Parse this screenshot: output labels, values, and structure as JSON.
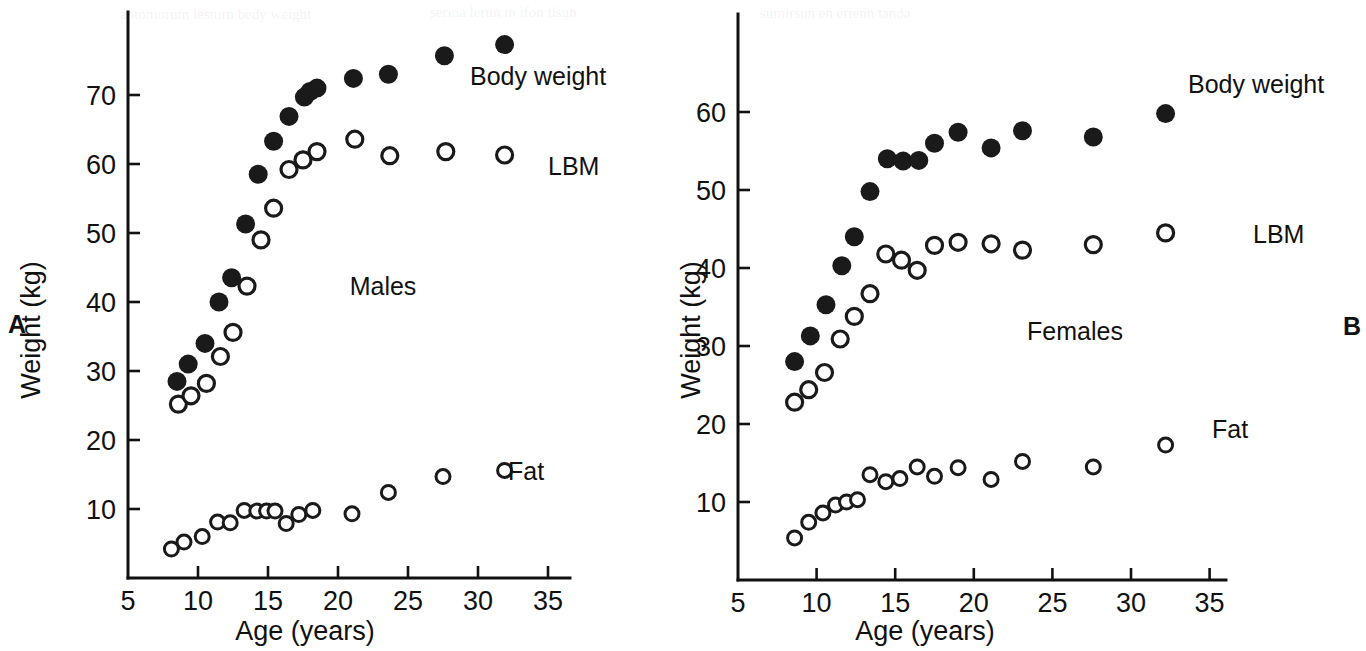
{
  "figure": {
    "panel_a_letter": "A",
    "panel_b_letter": "B"
  },
  "chart_data": [
    {
      "id": "males",
      "type": "scatter",
      "title": "",
      "group_label": "Males",
      "xlabel": "Age (years)",
      "ylabel": "Weight (kg)",
      "xlim": [
        5,
        36
      ],
      "ylim": [
        0,
        80
      ],
      "xticks": [
        5,
        10,
        15,
        20,
        25,
        30,
        35
      ],
      "yticks": [
        10,
        20,
        30,
        40,
        50,
        60,
        70
      ],
      "xtick_labels": [
        "5",
        "10",
        "15",
        "20",
        "25",
        "30",
        "35"
      ],
      "ytick_labels": [
        "10",
        "20",
        "30",
        "40",
        "50",
        "60",
        "70"
      ],
      "grid": false,
      "legend_position": "inline-right",
      "series": [
        {
          "name": "Body weight",
          "marker": "filled-circle",
          "label": "Body weight",
          "points": [
            [
              8.5,
              28.5
            ],
            [
              9.3,
              31.0
            ],
            [
              10.5,
              34.0
            ],
            [
              11.5,
              40.0
            ],
            [
              12.4,
              43.5
            ],
            [
              13.4,
              51.3
            ],
            [
              14.3,
              58.5
            ],
            [
              15.4,
              63.3
            ],
            [
              16.5,
              66.9
            ],
            [
              17.6,
              69.7
            ],
            [
              18.0,
              70.5
            ],
            [
              18.5,
              71.0
            ],
            [
              21.1,
              72.4
            ],
            [
              23.6,
              73.0
            ],
            [
              27.6,
              75.7
            ],
            [
              31.9,
              77.3
            ]
          ]
        },
        {
          "name": "LBM",
          "marker": "open-circle",
          "label": "LBM",
          "points": [
            [
              8.6,
              25.2
            ],
            [
              9.5,
              26.4
            ],
            [
              10.6,
              28.2
            ],
            [
              11.6,
              32.1
            ],
            [
              12.5,
              35.6
            ],
            [
              13.5,
              42.3
            ],
            [
              14.5,
              49.0
            ],
            [
              15.4,
              53.6
            ],
            [
              16.5,
              59.2
            ],
            [
              17.5,
              60.6
            ],
            [
              18.5,
              61.8
            ],
            [
              21.2,
              63.6
            ],
            [
              23.7,
              61.2
            ],
            [
              27.7,
              61.8
            ],
            [
              31.9,
              61.3
            ]
          ]
        },
        {
          "name": "Fat",
          "marker": "open-circle",
          "label": "Fat",
          "points": [
            [
              8.1,
              4.2
            ],
            [
              9.0,
              5.2
            ],
            [
              10.3,
              6.0
            ],
            [
              11.4,
              8.1
            ],
            [
              12.3,
              8.0
            ],
            [
              13.3,
              9.8
            ],
            [
              14.2,
              9.7
            ],
            [
              14.9,
              9.7
            ],
            [
              15.5,
              9.7
            ],
            [
              16.3,
              7.9
            ],
            [
              17.2,
              9.2
            ],
            [
              18.2,
              9.8
            ],
            [
              21.0,
              9.3
            ],
            [
              23.6,
              12.4
            ],
            [
              27.5,
              14.7
            ],
            [
              31.9,
              15.6
            ]
          ]
        }
      ]
    },
    {
      "id": "females",
      "type": "scatter",
      "title": "",
      "group_label": "Females",
      "xlabel": "Age (years)",
      "ylabel": "Weight (kg)",
      "xlim": [
        5,
        36
      ],
      "ylim": [
        0,
        66
      ],
      "xticks": [
        5,
        10,
        15,
        20,
        25,
        30,
        35
      ],
      "yticks": [
        10,
        20,
        30,
        40,
        50,
        60
      ],
      "xtick_labels": [
        "5",
        "10",
        "15",
        "20",
        "25",
        "30",
        "35"
      ],
      "ytick_labels": [
        "10",
        "20",
        "30",
        "40",
        "50",
        "60"
      ],
      "grid": false,
      "legend_position": "inline-right",
      "series": [
        {
          "name": "Body weight",
          "marker": "filled-circle",
          "label": "Body weight",
          "points": [
            [
              8.6,
              28.0
            ],
            [
              9.6,
              31.3
            ],
            [
              10.6,
              35.3
            ],
            [
              11.6,
              40.3
            ],
            [
              12.4,
              44.0
            ],
            [
              13.4,
              49.8
            ],
            [
              14.5,
              54.0
            ],
            [
              15.5,
              53.7
            ],
            [
              16.5,
              53.8
            ],
            [
              17.5,
              56.0
            ],
            [
              19.0,
              57.4
            ],
            [
              21.1,
              55.4
            ],
            [
              23.1,
              57.6
            ],
            [
              27.6,
              56.8
            ],
            [
              32.2,
              59.8
            ]
          ]
        },
        {
          "name": "LBM",
          "marker": "open-circle",
          "label": "LBM",
          "points": [
            [
              8.6,
              22.8
            ],
            [
              9.5,
              24.4
            ],
            [
              10.5,
              26.6
            ],
            [
              11.5,
              30.9
            ],
            [
              12.4,
              33.8
            ],
            [
              13.4,
              36.7
            ],
            [
              14.4,
              41.8
            ],
            [
              15.4,
              41.0
            ],
            [
              16.4,
              39.7
            ],
            [
              17.5,
              42.9
            ],
            [
              19.0,
              43.3
            ],
            [
              21.1,
              43.1
            ],
            [
              23.1,
              42.3
            ],
            [
              27.6,
              43.0
            ],
            [
              32.2,
              44.5
            ]
          ]
        },
        {
          "name": "Fat",
          "marker": "open-circle",
          "label": "Fat",
          "points": [
            [
              8.6,
              5.4
            ],
            [
              9.5,
              7.4
            ],
            [
              10.4,
              8.6
            ],
            [
              11.2,
              9.6
            ],
            [
              11.9,
              10.0
            ],
            [
              12.6,
              10.3
            ],
            [
              13.4,
              13.5
            ],
            [
              14.4,
              12.6
            ],
            [
              15.3,
              13.0
            ],
            [
              16.4,
              14.5
            ],
            [
              17.5,
              13.3
            ],
            [
              19.0,
              14.4
            ],
            [
              21.1,
              12.9
            ],
            [
              23.1,
              15.2
            ],
            [
              27.6,
              14.5
            ],
            [
              32.2,
              17.3
            ]
          ]
        }
      ]
    }
  ]
}
